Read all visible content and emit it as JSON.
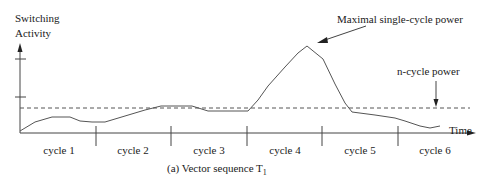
{
  "figure": {
    "y_axis_label_line1": "Switching",
    "y_axis_label_line2": "Activity",
    "x_axis_label": "Time",
    "annotation_peak": "Maximal single-cycle power",
    "annotation_avg": "n-cycle power",
    "caption_prefix": "(a) Vector sequence T",
    "caption_subscript": "1",
    "cycles": [
      "cycle 1",
      "cycle 2",
      "cycle 3",
      "cycle 4",
      "cycle 5",
      "cycle 6"
    ]
  },
  "colors": {
    "line": "#444444",
    "text": "#1a1a1a",
    "background": "#ffffff"
  }
}
